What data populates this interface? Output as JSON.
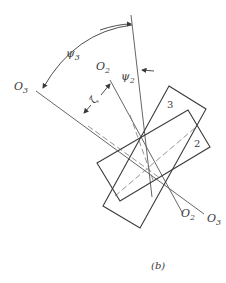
{
  "figure": {
    "caption": "(b)",
    "labels": {
      "o3_left": {
        "main": "O",
        "sub": "3"
      },
      "o2_top": {
        "main": "O",
        "sub": "2"
      },
      "o3_right": {
        "main": "O",
        "sub": "3"
      },
      "o2_bottom": {
        "main": "O",
        "sub": "2"
      },
      "psi3": {
        "main": "ψ",
        "sub": "3"
      },
      "psi2": {
        "main": "ψ",
        "sub": "2"
      },
      "zeta": "ζ",
      "rect3": "3",
      "rect2": "2"
    },
    "colors": {
      "line": "#3a3a3a",
      "light_line": "#8a8a8a"
    }
  }
}
